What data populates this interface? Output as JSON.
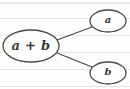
{
  "figure": {
    "kind": "expression-tree-diagram",
    "background_color": "#fdfdfc",
    "ink_color": "#4a4a4a",
    "text_color": "#3a3a3a"
  },
  "nodes": [
    {
      "id": "root",
      "label": "a + b",
      "role": "parent",
      "shape": "ellipse",
      "center_x": 31,
      "center_y": 46,
      "radius_x": 28,
      "radius_y": 16
    },
    {
      "id": "child-a",
      "label": "a",
      "role": "child",
      "shape": "ellipse",
      "center_x": 108,
      "center_y": 21,
      "radius_x": 18,
      "radius_y": 11
    },
    {
      "id": "child-b",
      "label": "b",
      "role": "child",
      "shape": "ellipse",
      "center_x": 108,
      "center_y": 73,
      "radius_x": 18,
      "radius_y": 11
    }
  ],
  "edges": [
    {
      "id": "edge-root-a",
      "from": "root",
      "to": "child-a",
      "x1": 57,
      "y1": 40,
      "x2": 92,
      "y2": 27
    },
    {
      "id": "edge-root-b",
      "from": "root",
      "to": "child-b",
      "x1": 57,
      "y1": 53,
      "x2": 92,
      "y2": 67
    }
  ],
  "paper_lines": [
    {
      "y": 2
    },
    {
      "y": 18
    },
    {
      "y": 35
    },
    {
      "y": 52
    },
    {
      "y": 69
    },
    {
      "y": 86
    }
  ]
}
